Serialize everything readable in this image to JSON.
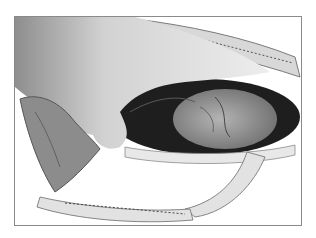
{
  "figure": {
    "kind": "grayscale surgical illustration",
    "colors": {
      "frame_border": "#8a8a8a",
      "background": "#ffffff",
      "glove_light": "#e6e6e6",
      "glove_dark": "#8c8c8c",
      "cavity_dark": "#1e1e1e",
      "organ": "#9a9a9a",
      "retractor": "#e2e2e2"
    }
  }
}
